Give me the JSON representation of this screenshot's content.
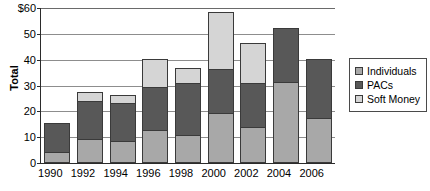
{
  "chart_data": {
    "type": "bar",
    "subtype": "stacked-vertical",
    "title": "",
    "xlabel": "",
    "ylabel": "Total",
    "ylim": [
      0,
      60
    ],
    "yticks": [
      0,
      10,
      20,
      30,
      40,
      50,
      60
    ],
    "ytick_labels": [
      "0",
      "10",
      "20",
      "30",
      "40",
      "50",
      "$60"
    ],
    "grid": true,
    "grid_axis": "y",
    "legend_position": "right",
    "categories": [
      "1990",
      "1992",
      "1994",
      "1996",
      "1998",
      "2000",
      "2002",
      "2004",
      "2006"
    ],
    "series": [
      {
        "name": "Individuals",
        "color": "#a8a8a8",
        "values": [
          4,
          9,
          8,
          12.5,
          10.5,
          19,
          13.5,
          31,
          17
        ]
      },
      {
        "name": "PACs",
        "color": "#585858",
        "values": [
          11,
          14.5,
          15,
          16.5,
          20,
          17,
          17,
          21,
          23
        ]
      },
      {
        "name": "Soft Money",
        "color": "#d5d5d5",
        "values": [
          0,
          3.5,
          3,
          11,
          6,
          22,
          15.5,
          0,
          0
        ]
      }
    ],
    "totals": [
      15,
      27,
      26,
      40,
      36.5,
      58,
      46,
      52,
      40
    ]
  },
  "legend": {
    "entries": [
      {
        "label": "Individuals",
        "color": "#a8a8a8"
      },
      {
        "label": "PACs",
        "color": "#585858"
      },
      {
        "label": "Soft Money",
        "color": "#d5d5d5"
      }
    ]
  }
}
